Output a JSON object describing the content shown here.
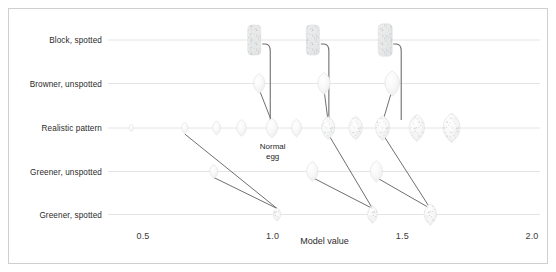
{
  "figure": {
    "background": "#ffffff",
    "frame_color": "#cfcfcf",
    "gridline_color": "#e4e4e4",
    "connector_color": "#6f6f6f",
    "egg_fill": "#f7f7f7",
    "egg_edge": "#e0e0e0",
    "speckle_color": "#b9c0c6"
  },
  "chart_data": {
    "type": "scatter",
    "title": "",
    "xlabel": "Model value",
    "ylabel": "",
    "xlim": [
      0.3,
      2.05
    ],
    "ylim": [
      0,
      6
    ],
    "grid": true,
    "legend": null,
    "xticks": [
      0.5,
      1.0,
      1.5,
      2.0
    ],
    "xtick_labels": [
      "0.5",
      "1.0",
      "1.5",
      "2.0"
    ],
    "ytick_labels": [
      "Block, spotted",
      "Browner, unspotted",
      "Realistic pattern",
      "Greener, unspotted",
      "Greener, spotted"
    ],
    "categories": [
      "Block, spotted",
      "Browner, unspotted",
      "Realistic pattern",
      "Greener, unspotted",
      "Greener, spotted"
    ],
    "annotations": [
      {
        "text": "Normal egg",
        "line1": "Normal",
        "line2": "egg",
        "x": 1.0,
        "y": 2.62
      }
    ],
    "series": [
      {
        "name": "Block, spotted",
        "row": 5,
        "marker": "speckled-block",
        "points": [
          {
            "x": 0.929,
            "size": 1.0,
            "speckled": true
          },
          {
            "x": 1.155,
            "size": 1.0,
            "speckled": true
          },
          {
            "x": 1.434,
            "size": 1.08,
            "speckled": true
          }
        ]
      },
      {
        "name": "Browner, unspotted",
        "row": 4,
        "marker": "egg-plain",
        "points": [
          {
            "x": 0.948,
            "size": 0.8,
            "speckled": false
          },
          {
            "x": 1.198,
            "size": 0.88,
            "speckled": false
          },
          {
            "x": 1.461,
            "size": 1.02,
            "speckled": false
          }
        ]
      },
      {
        "name": "Realistic pattern",
        "row": 3,
        "marker": "egg",
        "points": [
          {
            "x": 0.455,
            "size": 0.3,
            "speckled": false
          },
          {
            "x": 0.661,
            "size": 0.46,
            "speckled": false
          },
          {
            "x": 0.784,
            "size": 0.56,
            "speckled": false
          },
          {
            "x": 0.88,
            "size": 0.68,
            "speckled": false
          },
          {
            "x": 0.997,
            "size": 0.8,
            "speckled": false
          },
          {
            "x": 1.092,
            "size": 0.72,
            "speckled": false
          },
          {
            "x": 1.214,
            "size": 0.93,
            "speckled": true
          },
          {
            "x": 1.32,
            "size": 0.95,
            "speckled": true
          },
          {
            "x": 1.424,
            "size": 1.0,
            "speckled": true
          },
          {
            "x": 1.556,
            "size": 1.08,
            "speckled": true
          },
          {
            "x": 1.69,
            "size": 1.18,
            "speckled": true
          }
        ]
      },
      {
        "name": "Greener, unspotted",
        "row": 2,
        "marker": "egg-plain",
        "points": [
          {
            "x": 0.773,
            "size": 0.56,
            "speckled": false
          },
          {
            "x": 1.153,
            "size": 0.8,
            "speckled": false
          },
          {
            "x": 1.4,
            "size": 0.86,
            "speckled": false
          }
        ]
      },
      {
        "name": "Greener, spotted",
        "row": 1,
        "marker": "egg-spotted",
        "points": [
          {
            "x": 1.017,
            "size": 0.52,
            "speckled": true
          },
          {
            "x": 1.385,
            "size": 0.7,
            "speckled": true
          },
          {
            "x": 1.608,
            "size": 0.86,
            "speckled": true
          }
        ]
      }
    ],
    "connectors": [
      {
        "from": {
          "x": 0.929,
          "row": 5
        },
        "to": {
          "x": 0.997,
          "row": 3
        },
        "kind": "elbow"
      },
      {
        "from": {
          "x": 1.155,
          "row": 5
        },
        "to": {
          "x": 1.214,
          "row": 3
        },
        "kind": "elbow"
      },
      {
        "from": {
          "x": 1.434,
          "row": 5
        },
        "to": {
          "x": 1.424,
          "row": 3
        },
        "kind": "elbow"
      },
      {
        "from": {
          "x": 0.948,
          "row": 4
        },
        "to": {
          "x": 0.997,
          "row": 3
        },
        "kind": "straight"
      },
      {
        "from": {
          "x": 1.198,
          "row": 4
        },
        "to": {
          "x": 1.214,
          "row": 3
        },
        "kind": "straight"
      },
      {
        "from": {
          "x": 1.461,
          "row": 4
        },
        "to": {
          "x": 1.424,
          "row": 3
        },
        "kind": "straight"
      },
      {
        "from": {
          "x": 0.661,
          "row": 3
        },
        "to": {
          "x": 1.017,
          "row": 1
        },
        "kind": "straight"
      },
      {
        "from": {
          "x": 0.773,
          "row": 2
        },
        "to": {
          "x": 1.017,
          "row": 1
        },
        "kind": "straight"
      },
      {
        "from": {
          "x": 1.214,
          "row": 3
        },
        "to": {
          "x": 1.385,
          "row": 1
        },
        "kind": "straight"
      },
      {
        "from": {
          "x": 1.153,
          "row": 2
        },
        "to": {
          "x": 1.385,
          "row": 1
        },
        "kind": "straight"
      },
      {
        "from": {
          "x": 1.424,
          "row": 3
        },
        "to": {
          "x": 1.608,
          "row": 1
        },
        "kind": "straight"
      },
      {
        "from": {
          "x": 1.4,
          "row": 2
        },
        "to": {
          "x": 1.608,
          "row": 1
        },
        "kind": "straight"
      }
    ]
  }
}
